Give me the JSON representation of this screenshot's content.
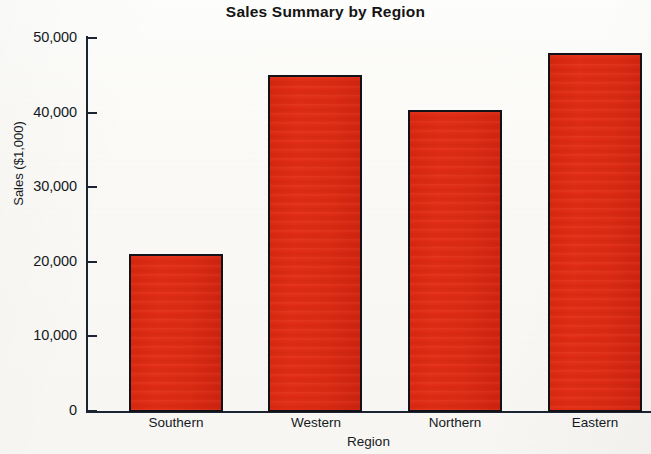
{
  "chart_data": {
    "type": "bar",
    "title": "Sales Summary by Region",
    "xlabel": "Region",
    "ylabel": "Sales ($1,000)",
    "categories": [
      "Southern",
      "Western",
      "Northern",
      "Eastern"
    ],
    "values": [
      21000,
      45000,
      40300,
      48000
    ],
    "ylim": [
      0,
      50000
    ],
    "yticks": [
      0,
      10000,
      20000,
      30000,
      40000,
      50000
    ],
    "ytick_labels": [
      "0",
      "10,000",
      "20,000",
      "30,000",
      "40,000",
      "50,000"
    ],
    "grid": false,
    "legend": null,
    "series": [
      {
        "name": "Sales",
        "values": [
          21000,
          45000,
          40300,
          48000
        ]
      }
    ],
    "colors": {
      "bar_fill": "#dd2b13",
      "bar_border": "#111318",
      "axis": "#1b2430",
      "text": "#15191e",
      "background": "#faf9f6"
    }
  }
}
